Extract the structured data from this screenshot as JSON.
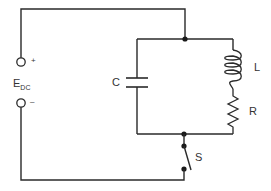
{
  "diagram": {
    "type": "circuit-schematic",
    "colors": {
      "wire": "#2a2a2a",
      "label": "#333333",
      "background": "#ffffff"
    },
    "source": {
      "label_main": "E",
      "label_sub": "DC",
      "plus": "+",
      "minus": "–"
    },
    "components": {
      "capacitor": {
        "label": "C"
      },
      "inductor": {
        "label": "L"
      },
      "resistor": {
        "label": "R"
      },
      "switch": {
        "label": "S"
      }
    }
  }
}
